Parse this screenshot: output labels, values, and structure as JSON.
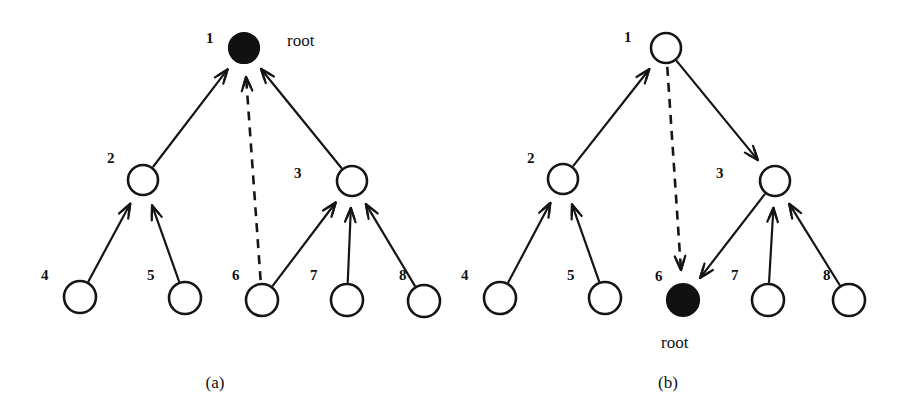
{
  "figure": {
    "background": "#ffffff",
    "ink": "#111111",
    "width": 907,
    "height": 412,
    "panels": [
      {
        "id": "panel-a",
        "caption": "(a)",
        "caption_pos": {
          "x": 215,
          "y": 388
        },
        "root_label": "root",
        "root_label_pos": {
          "x": 287,
          "y": 46
        },
        "root_node_id": "1",
        "nodes": [
          {
            "id": "1",
            "label": "1",
            "x": 244,
            "y": 48,
            "r": 15,
            "filled": true,
            "label_x": 206,
            "label_y": 43
          },
          {
            "id": "2",
            "label": "2",
            "x": 143,
            "y": 180,
            "r": 15,
            "filled": false,
            "label_x": 107,
            "label_y": 163
          },
          {
            "id": "3",
            "label": "3",
            "x": 352,
            "y": 181,
            "r": 15,
            "filled": false,
            "label_x": 294,
            "label_y": 178
          },
          {
            "id": "4",
            "label": "4",
            "x": 80,
            "y": 297,
            "r": 16,
            "filled": false,
            "label_x": 41,
            "label_y": 280
          },
          {
            "id": "5",
            "label": "5",
            "x": 185,
            "y": 298,
            "r": 16,
            "filled": false,
            "label_x": 147,
            "label_y": 280
          },
          {
            "id": "6",
            "label": "6",
            "x": 262,
            "y": 300,
            "r": 16,
            "filled": false,
            "label_x": 232,
            "label_y": 280
          },
          {
            "id": "7",
            "label": "7",
            "x": 347,
            "y": 300,
            "r": 16,
            "filled": false,
            "label_x": 310,
            "label_y": 280
          },
          {
            "id": "8",
            "label": "8",
            "x": 424,
            "y": 301,
            "r": 16,
            "filled": false,
            "label_x": 399,
            "label_y": 280
          }
        ],
        "edges": [
          {
            "from": "2",
            "to": "1",
            "style": "solid",
            "arrow": "to"
          },
          {
            "from": "3",
            "to": "1",
            "style": "solid",
            "arrow": "to"
          },
          {
            "from": "4",
            "to": "2",
            "style": "solid",
            "arrow": "to"
          },
          {
            "from": "5",
            "to": "2",
            "style": "solid",
            "arrow": "to"
          },
          {
            "from": "6",
            "to": "3",
            "style": "solid",
            "arrow": "to"
          },
          {
            "from": "7",
            "to": "3",
            "style": "solid",
            "arrow": "to"
          },
          {
            "from": "8",
            "to": "3",
            "style": "solid",
            "arrow": "to"
          },
          {
            "from": "6",
            "to": "1",
            "style": "dashed",
            "arrow": "to"
          }
        ]
      },
      {
        "id": "panel-b",
        "caption": "(b)",
        "caption_pos": {
          "x": 668,
          "y": 388
        },
        "root_label": "root",
        "root_label_pos": {
          "x": 661,
          "y": 348
        },
        "root_node_id": "6",
        "nodes": [
          {
            "id": "1",
            "label": "1",
            "x": 666,
            "y": 48,
            "r": 15,
            "filled": false,
            "label_x": 624,
            "label_y": 42
          },
          {
            "id": "2",
            "label": "2",
            "x": 563,
            "y": 179,
            "r": 15,
            "filled": false,
            "label_x": 527,
            "label_y": 163
          },
          {
            "id": "3",
            "label": "3",
            "x": 775,
            "y": 181,
            "r": 15,
            "filled": false,
            "label_x": 716,
            "label_y": 178
          },
          {
            "id": "4",
            "label": "4",
            "x": 500,
            "y": 298,
            "r": 16,
            "filled": false,
            "label_x": 461,
            "label_y": 280
          },
          {
            "id": "5",
            "label": "5",
            "x": 605,
            "y": 298,
            "r": 16,
            "filled": false,
            "label_x": 567,
            "label_y": 280
          },
          {
            "id": "6",
            "label": "6",
            "x": 683,
            "y": 300,
            "r": 16,
            "filled": true,
            "label_x": 655,
            "label_y": 281
          },
          {
            "id": "7",
            "label": "7",
            "x": 768,
            "y": 300,
            "r": 16,
            "filled": false,
            "label_x": 731,
            "label_y": 280
          },
          {
            "id": "8",
            "label": "8",
            "x": 849,
            "y": 300,
            "r": 16,
            "filled": false,
            "label_x": 823,
            "label_y": 280
          }
        ],
        "edges": [
          {
            "from": "2",
            "to": "1",
            "style": "solid",
            "arrow": "to"
          },
          {
            "from": "1",
            "to": "3",
            "style": "solid",
            "arrow": "to"
          },
          {
            "from": "3",
            "to": "6",
            "style": "solid",
            "arrow": "to"
          },
          {
            "from": "4",
            "to": "2",
            "style": "solid",
            "arrow": "to"
          },
          {
            "from": "5",
            "to": "2",
            "style": "solid",
            "arrow": "to"
          },
          {
            "from": "7",
            "to": "3",
            "style": "solid",
            "arrow": "to"
          },
          {
            "from": "8",
            "to": "3",
            "style": "solid",
            "arrow": "to"
          },
          {
            "from": "1",
            "to": "6",
            "style": "dashed",
            "arrow": "to"
          }
        ]
      }
    ]
  }
}
